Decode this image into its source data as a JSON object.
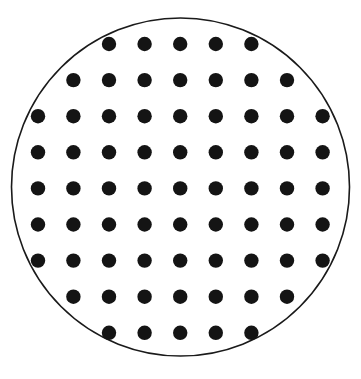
{
  "figure": {
    "type": "diagram",
    "width": 361,
    "height": 379,
    "background_color": "#ffffff"
  },
  "wafer": {
    "shape_name": "circle",
    "center_x": 180.5,
    "center_y": 187.0,
    "radius": 169.0,
    "outline_color": "#1a1a1a",
    "outline_width": 1.6,
    "fill_color": "#ffffff"
  },
  "dot_grid": {
    "dot_color": "#141414",
    "dot_radius": 7.2,
    "columns": 9,
    "rows": 9,
    "spacing_x": 35.6,
    "spacing_y": 36.1,
    "origin_x": 38.0,
    "origin_y": 44.0,
    "total_dots": 69,
    "row_counts": [
      5,
      7,
      9,
      9,
      9,
      9,
      9,
      7,
      5
    ],
    "rows_detail": [
      {
        "index": 1,
        "y": 44.0,
        "count": 5,
        "xs": [
          109.0,
          144.6,
          180.2,
          215.8,
          251.4
        ]
      },
      {
        "index": 2,
        "y": 80.1,
        "count": 7,
        "xs": [
          73.4,
          109.0,
          144.6,
          180.2,
          215.8,
          251.4,
          287.0
        ]
      },
      {
        "index": 3,
        "y": 116.2,
        "count": 9,
        "xs": [
          38.0,
          73.4,
          109.0,
          144.6,
          180.2,
          215.8,
          251.4,
          287.0,
          322.6
        ]
      },
      {
        "index": 4,
        "y": 152.3,
        "count": 9,
        "xs": [
          38.0,
          73.4,
          109.0,
          144.6,
          180.2,
          215.8,
          251.4,
          287.0,
          322.6
        ]
      },
      {
        "index": 5,
        "y": 188.4,
        "count": 9,
        "xs": [
          38.0,
          73.4,
          109.0,
          144.6,
          180.2,
          215.8,
          251.4,
          287.0,
          322.6
        ]
      },
      {
        "index": 6,
        "y": 224.5,
        "count": 9,
        "xs": [
          38.0,
          73.4,
          109.0,
          144.6,
          180.2,
          215.8,
          251.4,
          287.0,
          322.6
        ]
      },
      {
        "index": 7,
        "y": 260.6,
        "count": 9,
        "xs": [
          38.0,
          73.4,
          109.0,
          144.6,
          180.2,
          215.8,
          251.4,
          287.0,
          322.6
        ]
      },
      {
        "index": 8,
        "y": 296.7,
        "count": 7,
        "xs": [
          73.4,
          109.0,
          144.6,
          180.2,
          215.8,
          251.4,
          287.0
        ]
      },
      {
        "index": 9,
        "y": 332.8,
        "count": 5,
        "xs": [
          109.0,
          144.6,
          180.2,
          215.8,
          251.4
        ]
      }
    ]
  }
}
